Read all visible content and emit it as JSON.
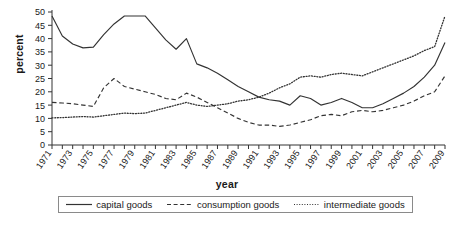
{
  "chart_data": {
    "type": "line",
    "title": "",
    "xlabel": "year",
    "ylabel": "percent",
    "ylim": [
      0,
      50
    ],
    "yticks": [
      0,
      5,
      10,
      15,
      20,
      25,
      30,
      35,
      40,
      45,
      50
    ],
    "xlim": [
      1971,
      2009
    ],
    "grid": false,
    "legend_position": "bottom",
    "x": [
      1971,
      1972,
      1973,
      1974,
      1975,
      1976,
      1977,
      1978,
      1979,
      1980,
      1981,
      1982,
      1983,
      1984,
      1985,
      1986,
      1987,
      1988,
      1989,
      1990,
      1991,
      1992,
      1993,
      1994,
      1995,
      1996,
      1997,
      1998,
      1999,
      2000,
      2001,
      2002,
      2003,
      2004,
      2005,
      2006,
      2007,
      2008,
      2009
    ],
    "xtick_labels": [
      "1971",
      "1973",
      "1975",
      "1977",
      "1979",
      "1981",
      "1983",
      "1985",
      "1987",
      "1989",
      "1991",
      "1993",
      "1995",
      "1997",
      "1999",
      "2001",
      "2003",
      "2005",
      "2007",
      "2009"
    ],
    "series": [
      {
        "name": "capital goods",
        "style": "solid",
        "color": "#333333",
        "values": [
          48.5,
          41.0,
          38.0,
          36.5,
          36.8,
          41.5,
          45.5,
          48.5,
          48.5,
          48.5,
          44.0,
          39.5,
          36.0,
          40.0,
          30.5,
          29.0,
          27.0,
          24.5,
          22.0,
          20.0,
          18.0,
          17.0,
          16.5,
          15.0,
          18.5,
          17.5,
          15.0,
          16.0,
          17.5,
          16.0,
          14.0,
          14.0,
          15.5,
          17.5,
          19.5,
          22.0,
          25.5,
          30.0,
          38.5
        ]
      },
      {
        "name": "consumption goods",
        "style": "dashed",
        "color": "#333333",
        "values": [
          16.0,
          15.8,
          15.5,
          15.0,
          14.5,
          21.5,
          25.0,
          22.0,
          21.0,
          20.0,
          19.0,
          17.5,
          17.0,
          19.5,
          18.0,
          16.0,
          14.0,
          12.0,
          10.0,
          8.5,
          7.5,
          7.5,
          7.0,
          7.5,
          8.5,
          9.5,
          11.0,
          11.5,
          11.0,
          12.5,
          13.0,
          12.5,
          13.0,
          14.0,
          15.0,
          16.5,
          18.5,
          20.0,
          26.0
        ]
      },
      {
        "name": "intermediate goods",
        "style": "dotted",
        "color": "#333333",
        "values": [
          10.2,
          10.3,
          10.5,
          10.7,
          10.5,
          11.0,
          11.5,
          12.0,
          11.8,
          12.0,
          13.0,
          14.0,
          15.0,
          16.0,
          15.0,
          14.5,
          15.0,
          15.5,
          16.5,
          17.0,
          18.0,
          19.5,
          21.5,
          23.0,
          25.5,
          26.0,
          25.5,
          26.5,
          27.0,
          26.5,
          26.0,
          27.5,
          29.0,
          30.5,
          32.0,
          33.5,
          35.5,
          37.0,
          48.5
        ]
      }
    ]
  },
  "legend": {
    "items": [
      {
        "label": "capital goods",
        "style": "solid"
      },
      {
        "label": "consumption goods",
        "style": "dashed"
      },
      {
        "label": "intermediate goods",
        "style": "dotted"
      }
    ]
  },
  "axes": {
    "y_title": "percent",
    "x_title": "year"
  }
}
